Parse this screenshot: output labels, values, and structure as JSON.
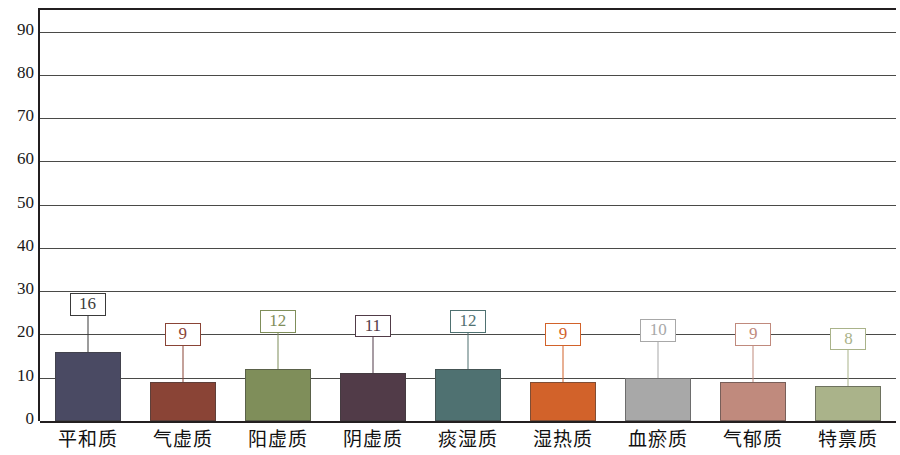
{
  "chart_data": {
    "type": "bar",
    "title": "",
    "xlabel": "",
    "ylabel": "",
    "ylim": [
      0,
      95
    ],
    "grid": true,
    "legend": "none",
    "categories": [
      "平和质",
      "气虚质",
      "阳虚质",
      "阴虚质",
      "痰湿质",
      "湿热质",
      "血瘀质",
      "气郁质",
      "特禀质"
    ],
    "values": [
      16,
      9,
      12,
      11,
      12,
      9,
      10,
      9,
      8
    ],
    "value_labels": [
      "16",
      "9",
      "12",
      "11",
      "12",
      "9",
      "10",
      "9",
      "8"
    ],
    "yticks": [
      "90",
      "80",
      "70",
      "60",
      "50",
      "40",
      "30",
      "20",
      "10",
      "0"
    ],
    "ytick_values": [
      90,
      80,
      70,
      60,
      50,
      40,
      30,
      20,
      10,
      0
    ],
    "bar_colors": [
      "#4a4a63",
      "#8a4436",
      "#7f8e5a",
      "#513b48",
      "#4f7171",
      "#d2622a",
      "#a8a8a8",
      "#c08a7d",
      "#aab38a"
    ],
    "label_colors": [
      "#3a3a3a",
      "#8a4436",
      "#7f8e5a",
      "#513b48",
      "#4f7171",
      "#d2622a",
      "#a8a8a8",
      "#c08a7d",
      "#aab38a"
    ],
    "axis_color": "#231f20",
    "grid_color": "#4a4a48"
  }
}
